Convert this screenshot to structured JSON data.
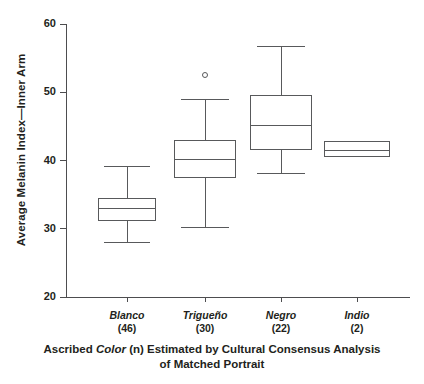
{
  "chart_data": {
    "type": "box",
    "title": "",
    "xlabel": "Ascribed Color (n) Estimated by Cultural Consensus Analysis of Matched Portrait",
    "xlabel_line1_pre": "Ascribed ",
    "xlabel_line1_em": "Color",
    "xlabel_line1_post": " (n) Estimated by Cultural Consensus Analysis",
    "xlabel_line2": "of Matched Portrait",
    "ylabel": "Average Melanin Index—Inner Arm",
    "ylim": [
      20,
      60
    ],
    "yticks": [
      20,
      30,
      40,
      50,
      60
    ],
    "ytick_labels": [
      "20",
      "30",
      "40",
      "50",
      "60"
    ],
    "grid": false,
    "legend": false,
    "categories": [
      "Blanco",
      "Trigueño",
      "Negro",
      "Indio"
    ],
    "category_counts": [
      "(46)",
      "(30)",
      "(22)",
      "(2)"
    ],
    "boxes": [
      {
        "category": "Blanco",
        "n": 46,
        "whisker_low": 28.0,
        "q1": 31.2,
        "median": 33.0,
        "q3": 34.5,
        "whisker_high": 39.2,
        "outliers": []
      },
      {
        "category": "Trigueño",
        "n": 30,
        "whisker_low": 30.2,
        "q1": 37.5,
        "median": 40.2,
        "q3": 43.0,
        "whisker_high": 49.0,
        "outliers": [
          52.5
        ]
      },
      {
        "category": "Negro",
        "n": 22,
        "whisker_low": 38.2,
        "q1": 41.5,
        "median": 45.2,
        "q3": 49.6,
        "whisker_high": 56.8,
        "outliers": []
      },
      {
        "category": "Indio",
        "n": 2,
        "whisker_low": 40.5,
        "q1": 40.5,
        "median": 41.5,
        "q3": 42.8,
        "whisker_high": 42.8,
        "outliers": []
      }
    ],
    "colors": {
      "stroke": "#58595b",
      "axis": "#4d4d4f",
      "text": "#231f20",
      "background": "#ffffff"
    }
  }
}
